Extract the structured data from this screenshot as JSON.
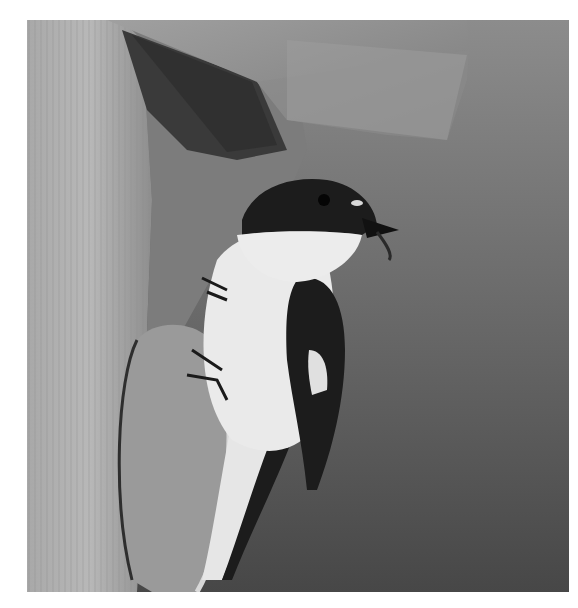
{
  "image": {
    "subject": "pied flycatcher at wooden nest box",
    "description": "Grayscale photograph of a black-and-white bird perched at the entrance of a wooden birdhouse, holding an insect in its beak, against a plain gray background.",
    "colors": {
      "background_top": "#8a8a8a",
      "background_bottom": "#4a4a4a",
      "wood_light": "#b4b4b4",
      "wood_mid": "#9a9a9a",
      "wood_dark": "#3a3a3a",
      "bird_white": "#eaeaea",
      "bird_black": "#1c1c1c",
      "page_background": "#ffffff"
    }
  }
}
